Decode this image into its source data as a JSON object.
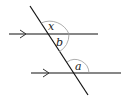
{
  "diagram": {
    "type": "parallel-lines-transversal",
    "lines": {
      "top": {
        "arrow": true
      },
      "bottom": {
        "arrow": true
      },
      "transversal": {}
    },
    "angles": [
      {
        "label": "x",
        "position": "top intersection, upper right"
      },
      {
        "label": "b",
        "position": "top intersection, lower right"
      },
      {
        "label": "a",
        "position": "bottom intersection, upper right"
      }
    ],
    "colors": {
      "line": "#111111",
      "arc": "#999999"
    }
  }
}
